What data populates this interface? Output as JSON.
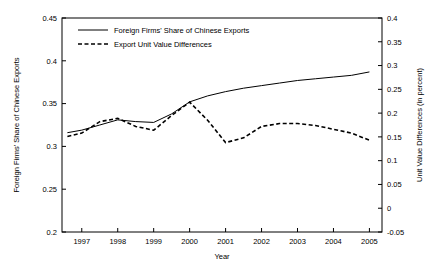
{
  "chart_data": {
    "type": "line",
    "title": "",
    "xlabel": "Year",
    "ylabel": "Foreign Firms' Share of Chinese Exports",
    "y2label": "Unit Value Differences (in percent)",
    "x": [
      1996.6,
      1997,
      1997.5,
      1998,
      1998.5,
      1999,
      1999.5,
      2000,
      2000.5,
      2001,
      2001.5,
      2002,
      2002.5,
      2003,
      2003.5,
      2004,
      2004.5,
      2005
    ],
    "xtick_labels": [
      "1997",
      "1998",
      "1999",
      "2000",
      "2001",
      "2002",
      "2003",
      "2004",
      "2005"
    ],
    "xtick_values": [
      1997,
      1998,
      1999,
      2000,
      2001,
      2002,
      2003,
      2004,
      2005
    ],
    "xlim": [
      1996.45,
      2005.35
    ],
    "ylim": [
      0.2,
      0.45
    ],
    "ytick_labels": [
      "0.2",
      "0.25",
      "0.3",
      "0.35",
      "0.4",
      "0.45"
    ],
    "ytick_values": [
      0.2,
      0.25,
      0.3,
      0.35,
      0.4,
      0.45
    ],
    "y2lim": [
      -0.05,
      0.4
    ],
    "y2tick_labels": [
      "-0.05",
      "0",
      "0.05",
      "0.1",
      "0.15",
      "0.2",
      "0.25",
      "0.3",
      "0.35",
      "0.4"
    ],
    "y2tick_values": [
      -0.05,
      0,
      0.05,
      0.1,
      0.15,
      0.2,
      0.25,
      0.3,
      0.35,
      0.4
    ],
    "grid": false,
    "legend_position": "top-left",
    "series": [
      {
        "name": "Foreign Firms' Share of Chinese Exports",
        "style": "solid",
        "axis": "left",
        "x": [
          1996.6,
          1997,
          1997.5,
          1998,
          1998.5,
          1999,
          1999.5,
          2000,
          2000.5,
          2001,
          2001.5,
          2002,
          2002.5,
          2003,
          2003.5,
          2004,
          2004.5,
          2005
        ],
        "values": [
          0.316,
          0.319,
          0.325,
          0.331,
          0.329,
          0.328,
          0.338,
          0.352,
          0.359,
          0.364,
          0.368,
          0.371,
          0.374,
          0.377,
          0.379,
          0.381,
          0.383,
          0.387
        ]
      },
      {
        "name": "Export Unit Value Differences",
        "style": "dashed",
        "axis": "right",
        "x": [
          1996.6,
          1997,
          1997.5,
          1998,
          1998.5,
          1999,
          1999.5,
          2000,
          2000.5,
          2001,
          2001.5,
          2002,
          2002.5,
          2003,
          2003.5,
          2004,
          2004.5,
          2005
        ],
        "values": [
          0.151,
          0.158,
          0.182,
          0.189,
          0.172,
          0.164,
          0.195,
          0.223,
          0.185,
          0.138,
          0.148,
          0.172,
          0.178,
          0.178,
          0.174,
          0.166,
          0.158,
          0.143
        ]
      }
    ],
    "legend": [
      {
        "label": "Foreign Firms' Share of Chinese Exports",
        "style": "solid"
      },
      {
        "label": "Export Unit Value Differences",
        "style": "dashed"
      }
    ]
  }
}
